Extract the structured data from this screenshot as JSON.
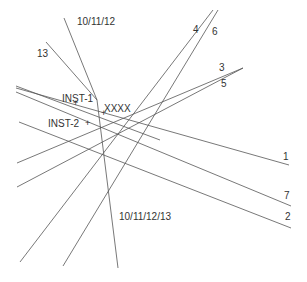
{
  "diagram": {
    "line_color": "#555555",
    "text_color": "#333333",
    "lines": [
      {
        "id": "10/11/12",
        "points": [
          [
            64,
            18
          ],
          [
            97,
            100
          ],
          [
            118,
            268
          ]
        ]
      },
      {
        "id": "13",
        "points": [
          [
            46,
            42
          ],
          [
            97,
            100
          ]
        ]
      },
      {
        "id": "4",
        "points": [
          [
            213,
            10
          ],
          [
            20,
            262
          ]
        ]
      },
      {
        "id": "6",
        "points": [
          [
            218,
            10
          ],
          [
            63,
            266
          ]
        ]
      },
      {
        "id": "3",
        "points": [
          [
            243,
            68
          ],
          [
            17,
            163
          ]
        ]
      },
      {
        "id": "5",
        "points": [
          [
            243,
            68
          ],
          [
            17,
            187
          ]
        ]
      },
      {
        "id": "1",
        "points": [
          [
            16,
            88
          ],
          [
            289,
            165
          ]
        ]
      },
      {
        "id": "7",
        "points": [
          [
            16,
            92
          ],
          [
            291,
            206
          ]
        ]
      },
      {
        "id": "2",
        "points": [
          [
            19,
            122
          ],
          [
            291,
            228
          ]
        ]
      },
      {
        "id": "1b",
        "points": [
          [
            16,
            86
          ],
          [
            160,
            140
          ]
        ]
      }
    ],
    "labels": [
      {
        "text": "10/11/12",
        "x": 77,
        "y": 17
      },
      {
        "text": "13",
        "x": 37,
        "y": 49
      },
      {
        "text": "4",
        "x": 193,
        "y": 25
      },
      {
        "text": "6",
        "x": 212,
        "y": 27
      },
      {
        "text": "3",
        "x": 219,
        "y": 63
      },
      {
        "text": "5",
        "x": 221,
        "y": 79
      },
      {
        "text": "INST-1",
        "x": 62,
        "y": 94
      },
      {
        "text": "XXXX",
        "x": 104,
        "y": 104
      },
      {
        "text": "INST-2",
        "x": 48,
        "y": 119
      },
      {
        "text": "1",
        "x": 283,
        "y": 152
      },
      {
        "text": "7",
        "x": 284,
        "y": 191
      },
      {
        "text": "2",
        "x": 285,
        "y": 212
      },
      {
        "text": "10/11/12/13",
        "x": 119,
        "y": 212
      }
    ],
    "markers": [
      {
        "name": "inst-1-marker",
        "x": 76,
        "y": 104
      },
      {
        "name": "xxxx-marker",
        "x": 104,
        "y": 114
      },
      {
        "name": "inst-2-marker",
        "x": 88,
        "y": 124
      }
    ]
  }
}
